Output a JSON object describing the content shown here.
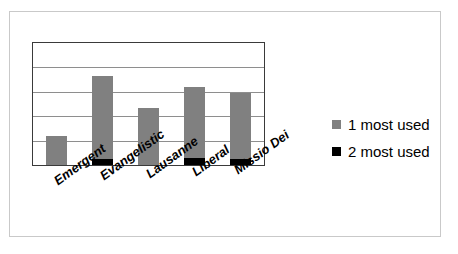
{
  "chart_data": {
    "type": "bar",
    "title": "",
    "subtitle": "",
    "xlabel": "",
    "ylabel": "",
    "categories": [
      "Emergent",
      "Evangelistic",
      "Lausanne",
      "Liberal",
      "Missio Dei"
    ],
    "series": [
      {
        "name": "1 most used",
        "color": "#808080",
        "values": [
          1.2,
          3.4,
          2.35,
          2.9,
          2.7
        ]
      },
      {
        "name": "2 most used",
        "color": "#000000",
        "values": [
          0,
          0.25,
          0,
          0.3,
          0.25
        ]
      },
      {
        "name": "totals",
        "values": [
          1.2,
          3.65,
          2.35,
          3.2,
          2.95
        ]
      }
    ],
    "stacked": true,
    "ylim": [
      0,
      5
    ],
    "gridlines": [
      0,
      1,
      2,
      3,
      4,
      5
    ],
    "grid": true,
    "grid_color": "#8e8e8e",
    "axis_tick_labels": [],
    "legend": {
      "position": "right",
      "entries": [
        {
          "label": "1 most used",
          "color": "#808080",
          "swatch": "square"
        },
        {
          "label": "2 most used",
          "color": "#000000",
          "swatch": "square"
        }
      ]
    },
    "plot_border_color": "#3a3a3a",
    "outer_border_color": "#c9c9c9",
    "background": "#ffffff",
    "category_label_rotation_deg": -36
  },
  "legend": {
    "entries": [
      {
        "label": "1 most used"
      },
      {
        "label": "2 most used"
      }
    ]
  },
  "categories": [
    {
      "label": "Emergent"
    },
    {
      "label": "Evangelistic"
    },
    {
      "label": "Lausanne"
    },
    {
      "label": "Liberal"
    },
    {
      "label": "Missio Dei"
    }
  ]
}
